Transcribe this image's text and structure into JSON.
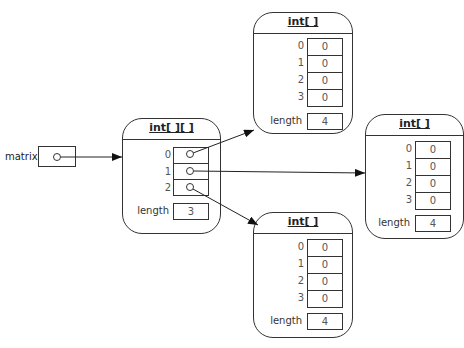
{
  "variable": {
    "name": "matrix",
    "value": "reference"
  },
  "outer_array": {
    "type": "int[ ][ ]",
    "indices": [
      "0",
      "1",
      "2"
    ],
    "length_label": "length",
    "length": "3"
  },
  "inner_arrays": [
    {
      "id": "top",
      "type": "int[ ]",
      "indices": [
        "0",
        "1",
        "2",
        "3"
      ],
      "values": [
        "0",
        "0",
        "0",
        "0"
      ],
      "length_label": "length",
      "length": "4"
    },
    {
      "id": "right",
      "type": "int[ ]",
      "indices": [
        "0",
        "1",
        "2",
        "3"
      ],
      "values": [
        "0",
        "0",
        "0",
        "0"
      ],
      "length_label": "length",
      "length": "4"
    },
    {
      "id": "bottom",
      "type": "int[ ]",
      "indices": [
        "0",
        "1",
        "2",
        "3"
      ],
      "values": [
        "0",
        "0",
        "0",
        "0"
      ],
      "length_label": "length",
      "length": "4"
    }
  ],
  "edges": [
    {
      "from": "matrix",
      "to": "outer_array"
    },
    {
      "from": "outer_array[0]",
      "to": "inner_arrays.top"
    },
    {
      "from": "outer_array[1]",
      "to": "inner_arrays.right"
    },
    {
      "from": "outer_array[2]",
      "to": "inner_arrays.bottom"
    }
  ],
  "colors": {
    "stroke": "#333333",
    "text": "#555555",
    "background": "#ffffff"
  }
}
